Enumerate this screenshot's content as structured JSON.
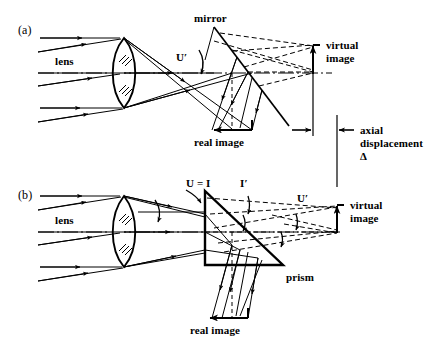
{
  "figure": {
    "width": 443,
    "height": 355,
    "background": "#ffffff",
    "ink": "#000000"
  },
  "panels": [
    {
      "id": "a",
      "label": "(a)",
      "element_label": "mirror",
      "labels": {
        "lens": "lens",
        "u_prime": "U′",
        "mirror": "mirror",
        "real_image": "real image",
        "virtual_image_line1": "virtual",
        "virtual_image_line2": "image"
      }
    },
    {
      "id": "b",
      "label": "(b)",
      "element_label": "prism",
      "labels": {
        "lens": "lens",
        "u_equals_i": "U = I",
        "i_prime": "I′",
        "u_prime": "U′",
        "prism": "prism",
        "real_image": "real image",
        "virtual_image_line1": "virtual",
        "virtual_image_line2": "image"
      }
    }
  ],
  "annotations": {
    "axial_displacement_line1": "axial",
    "axial_displacement_line2": "displacement",
    "axial_displacement_symbol": "Δ"
  },
  "geometry": {
    "panel_a": {
      "axis_y": 73,
      "lens_center_x": 124,
      "lens_top_y": 38,
      "lens_bottom_y": 108,
      "mirror_p1": [
        214,
        27
      ],
      "mirror_p2": [
        289,
        126
      ],
      "real_image_arrow_y": 130,
      "real_image_arrow_x1": 252,
      "real_image_arrow_x2": 212,
      "virtual_image_x": 313,
      "virtual_image_arrow_top_y": 45,
      "virtual_image_arrow_bottom_y": 74
    },
    "panel_b": {
      "axis_y": 232,
      "lens_center_x": 124,
      "lens_top_y": 196,
      "lens_bottom_y": 267,
      "prism_apex": [
        205,
        191
      ],
      "prism_bottom_left": [
        205,
        265
      ],
      "prism_bottom_right": [
        283,
        265
      ],
      "real_image_arrow_y": 318,
      "real_image_arrow_x1": 248,
      "real_image_arrow_x2": 208,
      "virtual_image_x": 337,
      "virtual_image_arrow_top_y": 205,
      "virtual_image_arrow_bottom_y": 233
    },
    "reference_lines": {
      "left_line_x": 313,
      "left_line_y1": 45,
      "left_line_y2": 136,
      "right_line_x": 337,
      "right_line_y1": 115,
      "right_line_y2": 187
    }
  }
}
